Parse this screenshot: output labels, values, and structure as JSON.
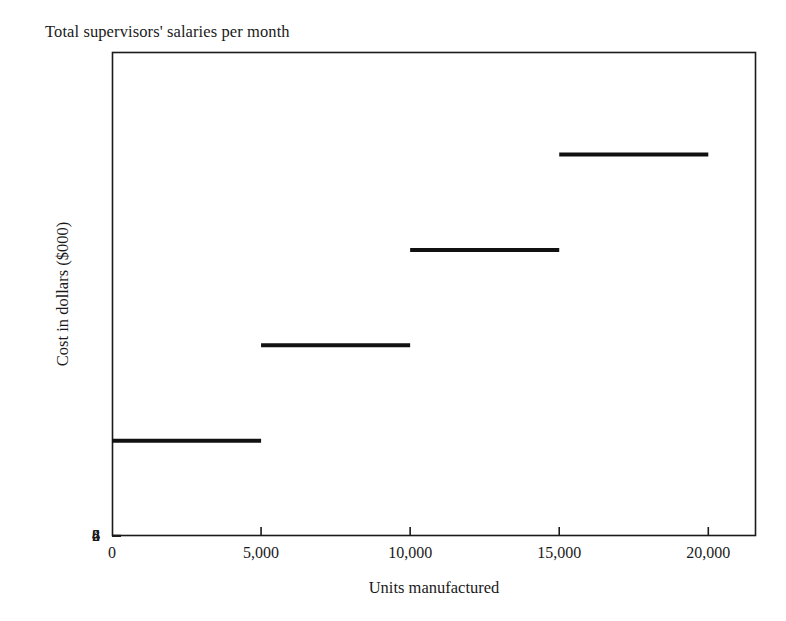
{
  "chart_data": {
    "type": "line",
    "subtype": "step",
    "title": "Total supervisors' salaries per month",
    "xlabel": "Units manufactured",
    "ylabel": "Cost in dollars ($000)",
    "xlim": [
      0,
      21600
    ],
    "ylim": [
      0,
      10150
    ],
    "grid": false,
    "legend": null,
    "xticks": [
      {
        "value": 0,
        "label": "0"
      },
      {
        "value": 5000,
        "label": "5,000"
      },
      {
        "value": 10000,
        "label": "10,000"
      },
      {
        "value": 15000,
        "label": "15,000"
      },
      {
        "value": 20000,
        "label": "20,000"
      }
    ],
    "yticks": [
      {
        "value": 2,
        "label": "2"
      },
      {
        "value": 4,
        "label": "4"
      },
      {
        "value": 6,
        "label": "6"
      },
      {
        "value": 8,
        "label": "8"
      }
    ],
    "series": [
      {
        "name": "Total supervisors' salaries",
        "color": "#111111",
        "line_width": 4,
        "steps": [
          {
            "x_start": 0,
            "x_end": 5000,
            "y": 2
          },
          {
            "x_start": 5000,
            "x_end": 10000,
            "y": 4
          },
          {
            "x_start": 10000,
            "x_end": 15000,
            "y": 6
          },
          {
            "x_start": 15000,
            "x_end": 20000,
            "y": 8
          }
        ]
      }
    ]
  },
  "style": {
    "frame_color": "#1a1a1a",
    "background": "#ffffff",
    "text_color": "#1a1a1a"
  }
}
